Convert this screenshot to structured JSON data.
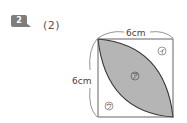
{
  "problem": {
    "badge_number": "2",
    "sub_number": "(2)"
  },
  "figure": {
    "top_dimension": "6cm",
    "left_dimension": "6cm",
    "region_labels": {
      "shaded": "ア",
      "top_right": "イ",
      "bottom_left": "ウ"
    },
    "colors": {
      "shaded_fill": "#b5b5b5",
      "line": "#333333"
    }
  }
}
